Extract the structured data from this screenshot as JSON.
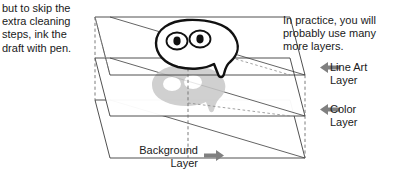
{
  "figure": {
    "colors": {
      "ink": "#1a1a1a",
      "line": "#3c3c3c",
      "dashed": "#6e6e6e",
      "arrow": "#808080",
      "shadow_gray": "#c8c8c8",
      "background": "#ffffff"
    }
  },
  "notes": {
    "left": {
      "lines": [
        "but to skip the",
        "extra cleaning",
        "steps, ink the",
        "draft with pen."
      ],
      "text": "but to skip the\nextra cleaning\nsteps, ink the\ndraft with pen."
    },
    "right": {
      "lines": [
        "In practice, you will",
        "probably use many",
        "more layers."
      ],
      "text": "In practice, you will\nprobably use many\nmore layers."
    }
  },
  "layers": [
    {
      "id": "line-art",
      "label": "Line Art\nLayer",
      "label_lines": [
        "Line Art",
        "Layer"
      ],
      "arrow": "arrow-left",
      "content": "black-outline-blob-with-two-eyes"
    },
    {
      "id": "color",
      "label": "Color\nLayer",
      "label_lines": [
        "Color",
        "Layer"
      ],
      "arrow": "arrow-left",
      "content": "gray-blob-silhouette"
    },
    {
      "id": "background",
      "label": "Background\nLayer",
      "label_lines": [
        "Background",
        "Layer"
      ],
      "arrow": "arrow-right",
      "content": "empty-plane"
    }
  ]
}
